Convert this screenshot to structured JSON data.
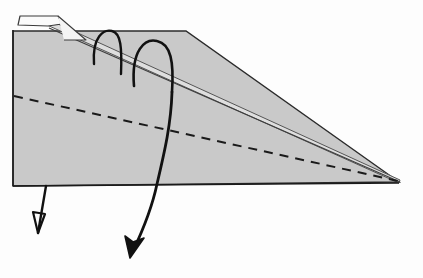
{
  "figure": {
    "kind": "line-drawing",
    "canvas": {
      "width": 423,
      "height": 278
    },
    "background_color": "#fdfdfd",
    "colors": {
      "body_fill": "#c9c9c9",
      "top_band_fill": "#dedede",
      "tab_fill": "#fbfbfb",
      "outline": "#1a1a1a",
      "soft_outline": "#4a4a4a",
      "dashed_line": "#1a1a1a",
      "arrow": "#111111"
    },
    "parts": [
      {
        "name": "wedge-body",
        "label": "Wedge body",
        "fill": "#c9c9c9",
        "stroke": "#2b2b2b",
        "points": "13,31 186,31 399,182 13,186"
      },
      {
        "name": "wedge-top-band",
        "label": "Top inclined surface band",
        "fill": "#dedede",
        "stroke": "#555555",
        "points": "47,25 58,24 400,180 399,183"
      },
      {
        "name": "wedge-tab",
        "label": "Folded tab at apex",
        "fill": "#fbfbfb",
        "stroke": "#3a3a3a",
        "points": "18,25 20,16 58,16 62,24 48,26"
      },
      {
        "name": "dashed-center-line",
        "label": "Dashed internal reference line",
        "stroke": "#1a1a1a",
        "dash": "9 7",
        "x1": 14,
        "y1": 96,
        "x2": 398,
        "y2": 181
      },
      {
        "name": "bottom-edge",
        "label": "Bottom edge of wedge",
        "stroke": "#1a1a1a",
        "x1": 13,
        "y1": 186,
        "x2": 399,
        "y2": 183
      },
      {
        "name": "loop-arrow-small",
        "label": "Small loop arrow over incline",
        "stroke": "#111111",
        "path": "M 94,64 C 92,36 104,29 112,31 C 121,33 122,48 121,74"
      },
      {
        "name": "loop-arrow-large",
        "label": "Large loop arrow over incline",
        "stroke": "#111111",
        "path": "M 134,86 C 131,50 145,38 157,41 C 171,44 174,62 172,92"
      },
      {
        "name": "long-descending-curve",
        "label": "Long curved arrow through body",
        "stroke": "#111111",
        "path": "M 172,92 C 171,124 165,150 157,184 C 152,208 142,232 133,251"
      },
      {
        "name": "large-arrowhead",
        "label": "Filled arrowhead of long curve",
        "fill": "#111111",
        "points": "130,258 125,236 133,242 144,238"
      },
      {
        "name": "small-down-arrow-shaft",
        "label": "Short arrow shaft below base",
        "stroke": "#111111",
        "x1": 46,
        "y1": 186,
        "x2": 38,
        "y2": 233
      },
      {
        "name": "small-down-arrowhead",
        "label": "Open arrowhead of short arrow",
        "stroke": "#111111",
        "points": "33,212 45,214 38,233"
      }
    ]
  }
}
